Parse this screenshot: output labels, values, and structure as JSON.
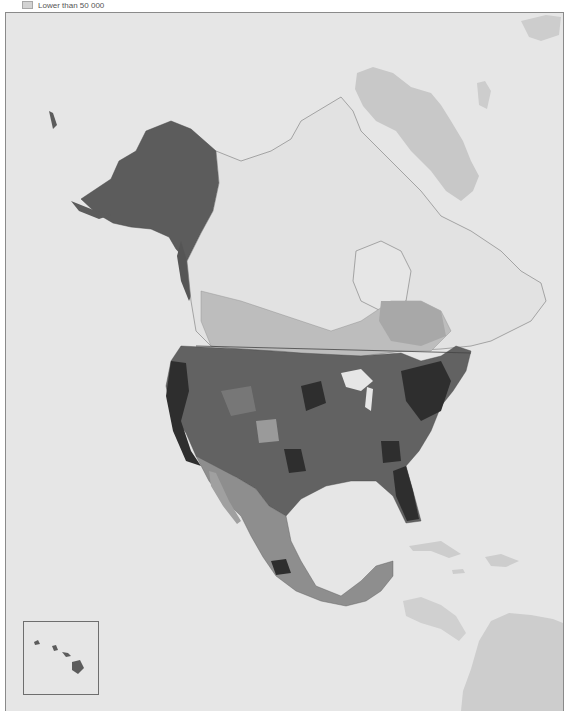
{
  "legend": {
    "items": [
      {
        "label": "Lower than 50 000",
        "color": "#d3d3d3"
      }
    ]
  },
  "map": {
    "title": "North America choropleth map",
    "colors": {
      "ocean": "#e6e6e6",
      "other_land": "#cdcdcd",
      "greenland": "#c8c8c8",
      "canada_north": "#e2e2e2",
      "class_1": "#bdbdbd",
      "class_2": "#9a9a9a",
      "class_3": "#777777",
      "class_4": "#555555",
      "class_5": "#2e2e2e",
      "alaska": "#5c5c5c",
      "border": "#6a6a6a"
    },
    "regions": [
      "Alaska",
      "Canada",
      "Greenland",
      "United States",
      "Mexico",
      "Central America",
      "Caribbean",
      "South America"
    ],
    "inset": {
      "label": "Hawaii"
    }
  }
}
